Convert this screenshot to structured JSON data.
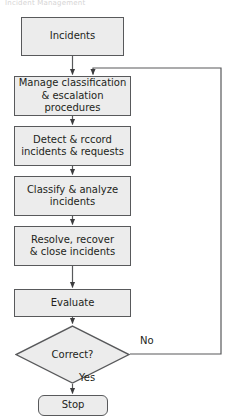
{
  "diagram": {
    "title_fragment": "Incident Management",
    "type": "flowchart",
    "orientation": "top-to-bottom",
    "colors": {
      "node_fill": "#ececec",
      "node_stroke": "#58595b",
      "connector": "#58595b",
      "text": "#231f20",
      "background": "#ffffff"
    },
    "nodes": [
      {
        "id": "incidents",
        "shape": "rectangle",
        "label": "Incidents"
      },
      {
        "id": "manage-classification",
        "shape": "rectangle",
        "label": "Manage classification\n& escalation\nprocedures"
      },
      {
        "id": "detect-record",
        "shape": "rectangle",
        "label": "Detect & rccord\nincidents & requests"
      },
      {
        "id": "classify-analyze",
        "shape": "rectangle",
        "label": "Classify & analyze\nincidents"
      },
      {
        "id": "resolve-recover",
        "shape": "rectangle",
        "label": "Resolve, recover\n& close incidents"
      },
      {
        "id": "evaluate",
        "shape": "rectangle",
        "label": "Evaluate"
      },
      {
        "id": "correct-decision",
        "shape": "diamond",
        "label": "Correct?"
      },
      {
        "id": "stop",
        "shape": "terminator",
        "label": "Stop"
      }
    ],
    "edge_labels": {
      "no": "No",
      "yes": "Yes"
    }
  }
}
